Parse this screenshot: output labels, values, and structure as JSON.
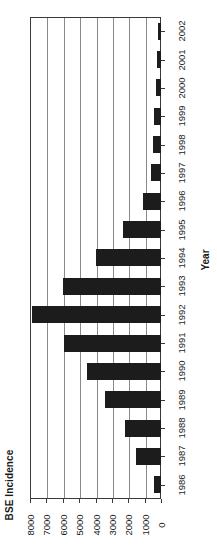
{
  "chart_data": {
    "type": "bar",
    "title": "",
    "orientation": "horizontal-rotated",
    "xlabel": "Year",
    "ylabel": "BSE Incidence",
    "categories": [
      "1986",
      "1987",
      "1988",
      "1989",
      "1990",
      "1991",
      "1992",
      "1993",
      "1994",
      "1995",
      "1996",
      "1997",
      "1998",
      "1999",
      "2000",
      "2001",
      "2002"
    ],
    "values": [
      400,
      1500,
      2200,
      3400,
      4500,
      5900,
      7900,
      6000,
      4000,
      2300,
      1100,
      600,
      500,
      400,
      300,
      250,
      180
    ],
    "value_ticks": [
      "8000",
      "7000",
      "6000",
      "5000",
      "4000",
      "3000",
      "2000",
      "1000",
      "0"
    ],
    "value_tick_numbers": [
      8000,
      7000,
      6000,
      5000,
      4000,
      3000,
      2000,
      1000,
      0
    ],
    "ylim": [
      0,
      8000
    ],
    "grid": true,
    "grid_axis": "value",
    "legend": "none",
    "bar_color": "#1c1c1c",
    "axis_color": "#3a3a3a",
    "grid_color": "#8a8a8a",
    "background_color": "#ffffff"
  }
}
